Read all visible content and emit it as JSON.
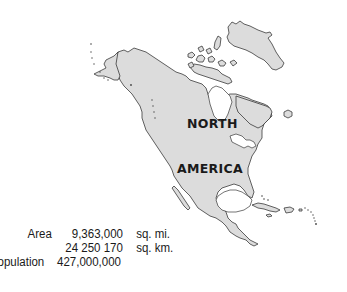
{
  "map": {
    "title": "NORTH AMERICA",
    "label_line1": "NORTH",
    "label_line2": "AMERICA",
    "colors": {
      "land": "#dcdcdc",
      "outline": "#3a3a3a",
      "background": "#ffffff",
      "text": "#1a1a1a"
    }
  },
  "stats": {
    "area": {
      "label": "Area",
      "value_mi": "9,363,000",
      "unit_mi": "sq. mi.",
      "value_km": "24 250 170",
      "unit_km": "sq. km."
    },
    "population": {
      "label": "Population",
      "value": "427,000,000"
    }
  }
}
